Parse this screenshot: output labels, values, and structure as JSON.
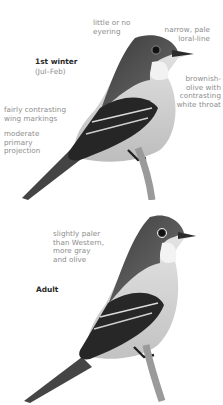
{
  "plates": [
    {
      "title": "1st winter",
      "subtitle": "(Jul–Feb)",
      "annotations": {
        "eyering": [
          "little or no",
          "eyering"
        ],
        "loral": [
          "narrow, pale",
          "loral-line"
        ],
        "throat": [
          "brownish-",
          "olive with",
          "contrasting",
          "white throat"
        ],
        "wing": [
          "fairly contrasting",
          "wing markings"
        ],
        "primary": [
          "moderate",
          "primary",
          "projection"
        ]
      }
    },
    {
      "title": "Adult",
      "annotations": {
        "color": [
          "slightly paler",
          "than Western,",
          "more gray",
          "and olive"
        ]
      }
    }
  ]
}
